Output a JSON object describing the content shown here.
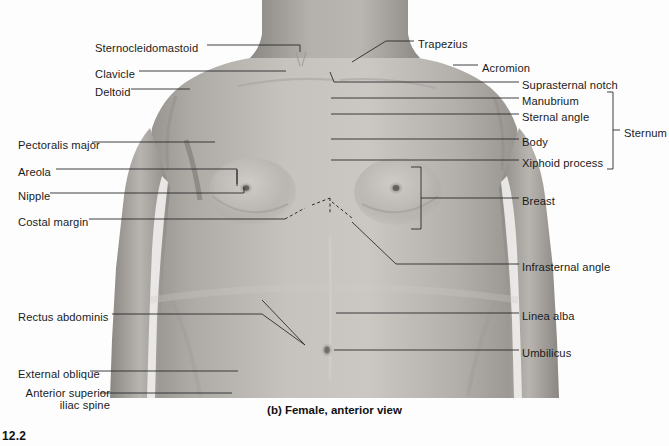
{
  "figure": {
    "caption": "(b) Female, anterior view",
    "figure_number": "12.2",
    "view_type": "photograph"
  },
  "colors": {
    "background": "#fdfdfd",
    "skin_light": "#c9c6c2",
    "skin_mid": "#b0aca8",
    "skin_dark": "#97938f",
    "shadow": "#7d7975",
    "leader_line": "#2b2b2b",
    "text": "#1b1b1b"
  },
  "labels_left": [
    {
      "id": "sternocleidomastoid",
      "text": "Sternocleidomastoid",
      "x": 95,
      "y": 48
    },
    {
      "id": "clavicle",
      "text": "Clavicle",
      "x": 95,
      "y": 74
    },
    {
      "id": "deltoid",
      "text": "Deltoid",
      "x": 95,
      "y": 92
    },
    {
      "id": "pectoralis-major",
      "text": "Pectoralis major",
      "x": 18,
      "y": 145
    },
    {
      "id": "areola",
      "text": "Areola",
      "x": 18,
      "y": 172
    },
    {
      "id": "nipple",
      "text": "Nipple",
      "x": 18,
      "y": 196
    },
    {
      "id": "costal-margin",
      "text": "Costal margin",
      "x": 18,
      "y": 222
    },
    {
      "id": "rectus-abdominis",
      "text": "Rectus abdominis",
      "x": 18,
      "y": 317
    },
    {
      "id": "external-oblique",
      "text": "External oblique",
      "x": 18,
      "y": 374
    },
    {
      "id": "anterior-superior-iliac-spine",
      "text": "Anterior superior iliac spine",
      "x": 18,
      "y": 396
    }
  ],
  "labels_right": [
    {
      "id": "trapezius",
      "text": "Trapezius",
      "x": 418,
      "y": 44
    },
    {
      "id": "acromion",
      "text": "Acromion",
      "x": 457,
      "y": 68
    },
    {
      "id": "suprasternal-notch",
      "text": "Suprasternal notch",
      "x": 524,
      "y": 85
    },
    {
      "id": "manubrium",
      "text": "Manubrium",
      "x": 524,
      "y": 101
    },
    {
      "id": "sternal-angle",
      "text": "Sternal angle",
      "x": 524,
      "y": 117
    },
    {
      "id": "body",
      "text": "Body",
      "x": 524,
      "y": 142
    },
    {
      "id": "xiphoid-process",
      "text": "Xiphoid process",
      "x": 524,
      "y": 163
    },
    {
      "id": "sternum",
      "text": "Sternum",
      "x": 624,
      "y": 133
    },
    {
      "id": "breast",
      "text": "Breast",
      "x": 524,
      "y": 201
    },
    {
      "id": "infrasternal-angle",
      "text": "Infrasternal angle",
      "x": 524,
      "y": 267
    },
    {
      "id": "linea-alba",
      "text": "Linea alba",
      "x": 524,
      "y": 316
    },
    {
      "id": "umbilicus",
      "text": "Umbilicus",
      "x": 524,
      "y": 353
    }
  ],
  "brackets": [
    {
      "id": "sternum-bracket",
      "groups": [
        "Manubrium",
        "Sternal angle",
        "Body",
        "Xiphoid process"
      ]
    },
    {
      "id": "breast-bracket",
      "groups": [
        "Breast"
      ]
    }
  ]
}
